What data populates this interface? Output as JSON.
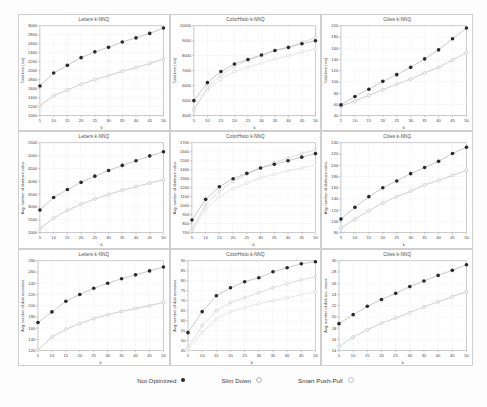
{
  "legend": {
    "entries": [
      {
        "label": "Not Optimized",
        "marker": "filled-circle-icon",
        "color": "#2a2a2a"
      },
      {
        "label": "Slim Down",
        "marker": "open-circle-icon",
        "color": "#b9b9b9"
      },
      {
        "label": "Smart Push-Pull",
        "marker": "open-circle-icon",
        "color": "#c6c6c6"
      }
    ]
  },
  "chart_data": [
    {
      "type": "line",
      "title": "Letters k-NNQ",
      "xlabel": "k",
      "ylabel": "Total time (ms)",
      "x": [
        5,
        10,
        15,
        20,
        25,
        30,
        35,
        40,
        45,
        50
      ],
      "xlim": [
        5,
        50
      ],
      "ylim": [
        1000,
        3000
      ],
      "yticks": [
        1000,
        1200,
        1400,
        1600,
        1800,
        2000,
        2200,
        2400,
        2600,
        2800,
        3000
      ],
      "xticks": [
        5,
        10,
        15,
        20,
        25,
        30,
        35,
        40,
        45,
        50
      ],
      "grid": true,
      "series": [
        {
          "name": "Not Optimized",
          "values": [
            1660,
            1950,
            2120,
            2290,
            2420,
            2520,
            2640,
            2730,
            2830,
            2950
          ]
        },
        {
          "name": "Slim Down",
          "values": [
            1225,
            1440,
            1570,
            1700,
            1800,
            1890,
            1990,
            2070,
            2160,
            2260
          ]
        },
        {
          "name": "Smart Push-Pull",
          "values": [
            1225,
            1440,
            1570,
            1700,
            1800,
            1890,
            1990,
            2070,
            2160,
            2260
          ]
        }
      ]
    },
    {
      "type": "line",
      "title": "ColorHisto k-NNQ",
      "xlabel": "k",
      "ylabel": "Total time (ms)",
      "x": [
        5,
        10,
        15,
        20,
        25,
        30,
        35,
        40,
        45,
        50
      ],
      "xlim": [
        5,
        50
      ],
      "ylim": [
        4000,
        10000
      ],
      "yticks": [
        4000,
        5000,
        6000,
        7000,
        8000,
        9000,
        10000
      ],
      "xticks": [
        5,
        10,
        15,
        20,
        25,
        30,
        35,
        40,
        45,
        50
      ],
      "grid": true,
      "series": [
        {
          "name": "Not Optimized",
          "values": [
            5000,
            6200,
            6950,
            7450,
            7750,
            8050,
            8350,
            8550,
            8800,
            9000
          ]
        },
        {
          "name": "Slim Down",
          "values": [
            4400,
            5900,
            6700,
            7300,
            7700,
            8000,
            8350,
            8600,
            8900,
            9200
          ]
        },
        {
          "name": "Smart Push-Pull",
          "values": [
            4400,
            5700,
            6400,
            6950,
            7250,
            7500,
            7800,
            8000,
            8250,
            8450
          ]
        }
      ]
    },
    {
      "type": "line",
      "title": "Cities k-NNQ",
      "xlabel": "k",
      "ylabel": "Total time (ms)",
      "x": [
        5,
        10,
        15,
        20,
        25,
        30,
        35,
        40,
        45,
        50
      ],
      "xlim": [
        5,
        50
      ],
      "ylim": [
        40,
        200
      ],
      "yticks": [
        40,
        60,
        80,
        100,
        120,
        140,
        160,
        180,
        200
      ],
      "xticks": [
        5,
        10,
        15,
        20,
        25,
        30,
        35,
        40,
        45,
        50
      ],
      "grid": true,
      "series": [
        {
          "name": "Not Optimized",
          "values": [
            59,
            74,
            87,
            101,
            113,
            126,
            141,
            157,
            177,
            196
          ]
        },
        {
          "name": "Slim Down",
          "values": [
            57,
            66,
            76,
            86,
            96,
            105,
            116,
            126,
            139,
            152
          ]
        },
        {
          "name": "Smart Push-Pull",
          "values": [
            57,
            66,
            76,
            86,
            96,
            105,
            116,
            126,
            139,
            152
          ]
        }
      ]
    },
    {
      "type": "line",
      "title": "Letters k-NNQ",
      "xlabel": "k",
      "ylabel": "Avg. number of distance calcs.",
      "x": [
        5,
        10,
        15,
        20,
        25,
        30,
        35,
        40,
        45,
        50
      ],
      "xlim": [
        5,
        50
      ],
      "ylim": [
        2000,
        5500
      ],
      "yticks": [
        2000,
        2500,
        3000,
        3500,
        4000,
        4500,
        5000,
        5500
      ],
      "xticks": [
        5,
        10,
        15,
        20,
        25,
        30,
        35,
        40,
        45,
        50
      ],
      "grid": true,
      "series": [
        {
          "name": "Not Optimized",
          "values": [
            2880,
            3370,
            3680,
            3960,
            4200,
            4420,
            4620,
            4800,
            4990,
            5150
          ]
        },
        {
          "name": "Slim Down",
          "values": [
            2150,
            2570,
            2860,
            3110,
            3310,
            3490,
            3650,
            3790,
            3930,
            4060
          ]
        },
        {
          "name": "Smart Push-Pull",
          "values": [
            2150,
            2570,
            2860,
            3110,
            3310,
            3490,
            3650,
            3790,
            3930,
            4060
          ]
        }
      ]
    },
    {
      "type": "line",
      "title": "ColorHisto k-NNQ",
      "xlabel": "k",
      "ylabel": "Avg. number of distance calcs.",
      "x": [
        5,
        10,
        15,
        20,
        25,
        30,
        35,
        40,
        45,
        50
      ],
      "xlim": [
        5,
        50
      ],
      "ylim": [
        700,
        1700
      ],
      "yticks": [
        700,
        800,
        900,
        1000,
        1100,
        1200,
        1300,
        1400,
        1500,
        1600,
        1700
      ],
      "xticks": [
        5,
        10,
        15,
        20,
        25,
        30,
        35,
        40,
        45,
        50
      ],
      "grid": true,
      "series": [
        {
          "name": "Not Optimized",
          "values": [
            840,
            1070,
            1210,
            1300,
            1360,
            1420,
            1460,
            1500,
            1540,
            1580
          ]
        },
        {
          "name": "Slim Down",
          "values": [
            730,
            1010,
            1160,
            1270,
            1350,
            1420,
            1480,
            1530,
            1580,
            1620
          ]
        },
        {
          "name": "Smart Push-Pull",
          "values": [
            730,
            960,
            1100,
            1190,
            1250,
            1310,
            1350,
            1390,
            1420,
            1450
          ]
        }
      ]
    },
    {
      "type": "line",
      "title": "Cities k-NNQ",
      "xlabel": "k",
      "ylabel": "Avg. number of distance calcs.",
      "x": [
        5,
        10,
        15,
        20,
        25,
        30,
        35,
        40,
        45,
        50
      ],
      "xlim": [
        5,
        50
      ],
      "ylim": [
        80,
        240
      ],
      "yticks": [
        80,
        100,
        120,
        140,
        160,
        180,
        200,
        220,
        240
      ],
      "xticks": [
        5,
        10,
        15,
        20,
        25,
        30,
        35,
        40,
        45,
        50
      ],
      "grid": true,
      "series": [
        {
          "name": "Not Optimized",
          "values": [
            104,
            125,
            144,
            160,
            172,
            185,
            196,
            207,
            221,
            232
          ]
        },
        {
          "name": "Slim Down",
          "values": [
            88,
            104,
            119,
            133,
            144,
            154,
            165,
            173,
            182,
            191
          ]
        },
        {
          "name": "Smart Push-Pull",
          "values": [
            88,
            104,
            119,
            133,
            144,
            154,
            165,
            173,
            182,
            191
          ]
        }
      ]
    },
    {
      "type": "line",
      "title": "Letters k-NNQ",
      "xlabel": "k",
      "ylabel": "Avg. number of disk accesses",
      "x": [
        5,
        10,
        15,
        20,
        25,
        30,
        35,
        40,
        45,
        50
      ],
      "xlim": [
        5,
        50
      ],
      "ylim": [
        120,
        280
      ],
      "yticks": [
        120,
        140,
        160,
        180,
        200,
        220,
        240,
        260,
        280
      ],
      "xticks": [
        5,
        10,
        15,
        20,
        25,
        30,
        35,
        40,
        45,
        50
      ],
      "grid": true,
      "series": [
        {
          "name": "Not Optimized",
          "values": [
            170,
            189,
            208,
            220,
            231,
            240,
            248,
            255,
            262,
            269
          ]
        },
        {
          "name": "Slim Down",
          "values": [
            121,
            144,
            158,
            168,
            177,
            184,
            190,
            195,
            200,
            206
          ]
        },
        {
          "name": "Smart Push-Pull",
          "values": [
            121,
            144,
            158,
            168,
            177,
            184,
            190,
            195,
            200,
            206
          ]
        }
      ]
    },
    {
      "type": "line",
      "title": "ColorHisto k-NNQ",
      "xlabel": "k",
      "ylabel": "Avg. number of disk accesses",
      "x": [
        5,
        10,
        15,
        20,
        25,
        30,
        35,
        40,
        45,
        50
      ],
      "xlim": [
        5,
        50
      ],
      "ylim": [
        45,
        90
      ],
      "yticks": [
        45,
        50,
        55,
        60,
        65,
        70,
        75,
        80,
        85,
        90
      ],
      "xticks": [
        5,
        10,
        15,
        20,
        25,
        30,
        35,
        40,
        45,
        50
      ],
      "grid": true,
      "series": [
        {
          "name": "Not Optimized",
          "values": [
            54,
            64.5,
            72.5,
            76.5,
            79.5,
            81.5,
            84.5,
            86.5,
            88.5,
            89.5
          ]
        },
        {
          "name": "Slim Down",
          "values": [
            46.5,
            57.5,
            65,
            69,
            71.5,
            74,
            76.5,
            78.5,
            80.5,
            82
          ]
        },
        {
          "name": "Smart Push-Pull",
          "values": [
            45.5,
            54,
            61,
            64.5,
            66.5,
            68.5,
            70,
            71.5,
            73,
            74.5
          ]
        }
      ]
    },
    {
      "type": "line",
      "title": "Cities k-NNQ",
      "xlabel": "k",
      "ylabel": "Avg. number of disk acc. esses",
      "x": [
        5,
        10,
        15,
        20,
        25,
        30,
        35,
        40,
        45,
        50
      ],
      "xlim": [
        5,
        50
      ],
      "ylim": [
        14,
        30
      ],
      "yticks": [
        14,
        16,
        18,
        20,
        22,
        24,
        26,
        28,
        30
      ],
      "xticks": [
        5,
        10,
        15,
        20,
        25,
        30,
        35,
        40,
        45,
        50
      ],
      "grid": true,
      "series": [
        {
          "name": "Not Optimized",
          "values": [
            18.8,
            20.4,
            21.9,
            23.1,
            24.2,
            25.4,
            26.4,
            27.4,
            28.3,
            29.3
          ]
        },
        {
          "name": "Slim Down",
          "values": [
            14.7,
            16.4,
            17.7,
            18.9,
            19.8,
            20.8,
            21.8,
            22.7,
            23.6,
            24.5
          ]
        },
        {
          "name": "Smart Push-Pull",
          "values": [
            14.7,
            16.4,
            17.7,
            18.9,
            19.8,
            20.8,
            21.8,
            22.7,
            23.6,
            24.5
          ]
        }
      ]
    }
  ]
}
